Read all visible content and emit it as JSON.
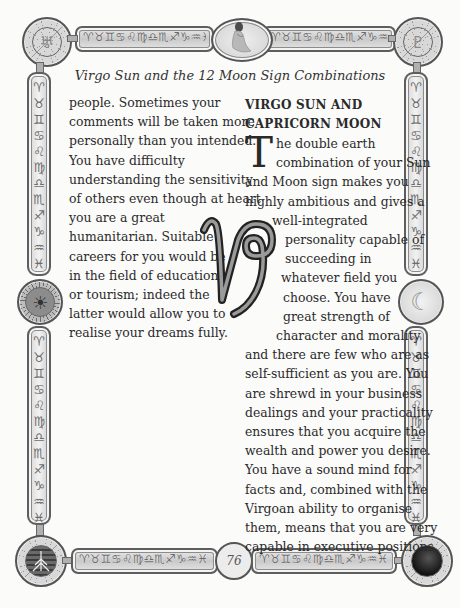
{
  "page": {
    "subtitle": "Virgo Sun and the 12 Moon Sign Combinations",
    "page_number": "76"
  },
  "frame": {
    "zodiac_glyphs_horizontal": "♈♉♊♋♌♍♎♏♐♑♒♓",
    "zodiac_glyphs_vertical": "♈♉♊♋♌♍♎♏♐♑♒♓",
    "top_center_image": "virgo-maiden",
    "corner_top_left": "uranus-glyph",
    "corner_top_right": "pluto-glyph",
    "corner_bottom_left": "tree-roots",
    "corner_bottom_right": "portrait",
    "left_middle": "sun-face",
    "right_middle": "crescent-moon",
    "icons": {
      "top_left": "♅",
      "top_right": "♇",
      "left_mid": "☀",
      "right_mid": "☾",
      "virgo": "♍"
    }
  },
  "left_column": {
    "lines": [
      "people. Sometimes your",
      "comments will be taken more",
      "personally than you intended.",
      "You have difficulty",
      "understanding the sensitivity",
      "of others even though at heart",
      "you are a great",
      "humanitarian. Suitable",
      "careers for you would be",
      "in the field of education",
      "or tourism; indeed the",
      "latter would allow you to",
      "realise your dreams fully."
    ]
  },
  "right_column": {
    "heading_line1": "VIRGO SUN AND",
    "heading_line2": "CAPRICORN MOON",
    "drop_cap": "T",
    "lines": [
      "he double earth",
      "combination of your Sun",
      "and Moon sign makes you",
      "highly ambitious and gives a",
      "well-integrated",
      "personality capable of",
      "succeeding in",
      "whatever field you",
      "choose. You have",
      "great strength of",
      "character and morality",
      "and there are few who are as",
      "self-sufficient as you are. You",
      "are shrewd in your business",
      "dealings and your practicality",
      "ensures that you acquire the",
      "wealth and power you desire.",
      "You have a sound mind for",
      "facts and, combined with the",
      "Virgoan ability to organise",
      "them, means that you are very",
      "capable in executive positions."
    ]
  },
  "capricorn_symbol": "♑"
}
